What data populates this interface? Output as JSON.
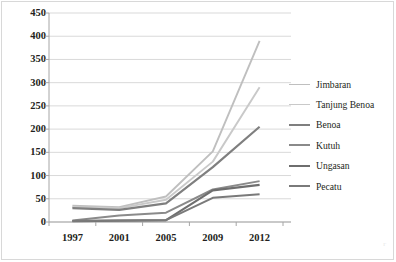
{
  "chart_data": {
    "type": "line",
    "title": "",
    "subtitle": "",
    "xlabel": "",
    "ylabel": "",
    "categories": [
      "1997",
      "2001",
      "2005",
      "2009",
      "2012"
    ],
    "ylim": [
      0,
      450
    ],
    "ytick_step": 50,
    "yticks": [
      "0",
      "50",
      "100",
      "150",
      "200",
      "250",
      "300",
      "350",
      "400",
      "450"
    ],
    "grid": "horizontal",
    "legend_position": "right",
    "series": [
      {
        "name": "Jimbaran",
        "values": [
          35,
          32,
          55,
          152,
          390
        ],
        "color": "#bfbfbf"
      },
      {
        "name": "Tanjung Benoa",
        "values": [
          32,
          30,
          48,
          130,
          290
        ],
        "color": "#c9c9c9"
      },
      {
        "name": "Benoa",
        "values": [
          30,
          26,
          40,
          118,
          205
        ],
        "color": "#7f7f7f"
      },
      {
        "name": "Kutuh",
        "values": [
          3,
          14,
          20,
          70,
          88
        ],
        "color": "#8a8a8a"
      },
      {
        "name": "Ungasan",
        "values": [
          2,
          3,
          4,
          68,
          80
        ],
        "color": "#6e6e6e"
      },
      {
        "name": "Pecatu",
        "values": [
          2,
          3,
          4,
          52,
          60
        ],
        "color": "#7a7a7a"
      }
    ]
  },
  "legend": {
    "items": [
      {
        "label": "Jimbaran"
      },
      {
        "label": "Tanjung Benoa"
      },
      {
        "label": "Benoa"
      },
      {
        "label": "Kutuh"
      },
      {
        "label": "Ungasan"
      },
      {
        "label": "Pecatu"
      }
    ]
  },
  "axes": {
    "y_labels": [
      "450",
      "400",
      "350",
      "300",
      "250",
      "200",
      "150",
      "100",
      "50",
      "0"
    ],
    "x_labels": [
      "1997",
      "2001",
      "2005",
      "2009",
      "2012"
    ]
  },
  "colors": {
    "grid": "#d9d9d9",
    "axis": "#a6a6a6",
    "text": "#231f20",
    "border": "#d8d8d8",
    "background": "#ffffff"
  }
}
